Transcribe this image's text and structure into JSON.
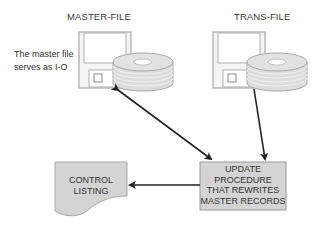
{
  "diagram": {
    "nodes": {
      "master_file": {
        "label": "MASTER-FILE",
        "type": "disk-storage"
      },
      "trans_file": {
        "label": "TRANS-FILE",
        "type": "disk-storage"
      },
      "update_procedure": {
        "lines": [
          "UPDATE",
          "PROCEDURE",
          "THAT REWRITES",
          "MASTER RECORDS"
        ],
        "type": "process"
      },
      "control_listing": {
        "lines": [
          "CONTROL",
          "LISTING"
        ],
        "type": "document"
      }
    },
    "annotation": {
      "lines": [
        "The master file",
        "serves as I-O"
      ]
    },
    "edges": [
      {
        "from": "master_file",
        "to": "update_procedure",
        "direction": "bidirectional"
      },
      {
        "from": "trans_file",
        "to": "update_procedure",
        "direction": "forward"
      },
      {
        "from": "update_procedure",
        "to": "control_listing",
        "direction": "forward"
      }
    ],
    "colors": {
      "box_fill": "#d4d4d4",
      "box_stroke": "#9a9a9a",
      "floppy_fill": "#f4f4f4",
      "floppy_stroke": "#a8a8a8",
      "disk_fill": "#dcdcdc",
      "arrow": "#222222"
    }
  }
}
